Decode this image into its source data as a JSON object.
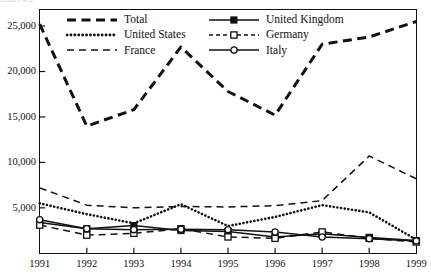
{
  "page": {
    "clipped_header_text": "Chart 4.2"
  },
  "chart_data": {
    "type": "line",
    "title": "",
    "xlabel": "",
    "ylabel": "",
    "x": [
      1991,
      1992,
      1993,
      1994,
      1995,
      1996,
      1997,
      1998,
      1999
    ],
    "xticklabels": [
      "1991",
      "1992",
      "1993",
      "1994",
      "1995",
      "1996",
      "1997",
      "1998",
      "1999"
    ],
    "yticks": [
      5000,
      10000,
      15000,
      20000,
      25000
    ],
    "yticklabels": [
      "5,000",
      "10,000",
      "15,000",
      "20,000",
      "25,000"
    ],
    "ylim": [
      0,
      26800
    ],
    "grid": false,
    "legend_position": "top-inside",
    "series": [
      {
        "name": "Total",
        "style": "thick-dashed",
        "marker": "none",
        "color": "#111111",
        "values": [
          25200,
          14000,
          15800,
          22700,
          17800,
          15200,
          23000,
          23800,
          25500
        ]
      },
      {
        "name": "United States",
        "style": "dotted",
        "marker": "none",
        "color": "#111111",
        "values": [
          5500,
          4300,
          3300,
          5400,
          3000,
          4000,
          5300,
          4500,
          1500
        ]
      },
      {
        "name": "France",
        "style": "dashed",
        "marker": "none",
        "color": "#111111",
        "values": [
          7200,
          5300,
          5000,
          5150,
          5100,
          5250,
          5800,
          10700,
          8200
        ]
      },
      {
        "name": "United Kingdom",
        "style": "solid",
        "marker": "filled-square",
        "color": "#111111",
        "values": [
          3400,
          2700,
          3050,
          2500,
          2400,
          1800,
          2150,
          1750,
          1400
        ]
      },
      {
        "name": "Germany",
        "style": "dashed",
        "marker": "open-square",
        "color": "#111111",
        "values": [
          3100,
          2000,
          2200,
          2700,
          1800,
          1650,
          2350,
          1650,
          1250
        ]
      },
      {
        "name": "Italy",
        "style": "solid",
        "marker": "open-circle",
        "color": "#111111",
        "values": [
          3700,
          2700,
          2600,
          2650,
          2600,
          2350,
          1800,
          1600,
          1350
        ]
      }
    ]
  },
  "legend": {
    "entries": [
      {
        "label": "Total",
        "key": "thick-dashed-key"
      },
      {
        "label": "United Kingdom",
        "key": "solid-filled-square-key"
      },
      {
        "label": "United States",
        "key": "dotted-key"
      },
      {
        "label": "Germany",
        "key": "dashed-open-square-key"
      },
      {
        "label": "France",
        "key": "dashed-key"
      },
      {
        "label": "Italy",
        "key": "solid-open-circle-key"
      }
    ]
  }
}
